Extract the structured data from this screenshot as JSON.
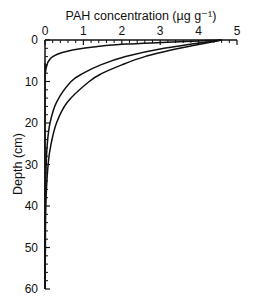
{
  "chart_data": {
    "type": "line",
    "title": "",
    "xlabel": "PAH concentration (µg g⁻¹)",
    "ylabel": "Depth (cm)",
    "xlim": [
      0,
      5
    ],
    "ylim": [
      60,
      0
    ],
    "x_axis_position": "top",
    "y_inverted": true,
    "grid": false,
    "xticks": [
      0,
      1,
      2,
      3,
      4,
      5
    ],
    "yticks": [
      0,
      10,
      20,
      30,
      40,
      50,
      60
    ],
    "series": [
      {
        "name": "profile-1",
        "depth": [
          0,
          1,
          2,
          3,
          4,
          5,
          6,
          8,
          10,
          60
        ],
        "concentration": [
          4.6,
          2.1,
          1.0,
          0.45,
          0.2,
          0.1,
          0.05,
          0.01,
          0.0,
          0.0
        ]
      },
      {
        "name": "profile-2",
        "depth": [
          0,
          2,
          4,
          6,
          8,
          10,
          15,
          20,
          25,
          30,
          40,
          60
        ],
        "concentration": [
          4.6,
          3.1,
          2.1,
          1.45,
          1.0,
          0.68,
          0.3,
          0.13,
          0.06,
          0.03,
          0.01,
          0.0
        ]
      },
      {
        "name": "profile-3",
        "depth": [
          0,
          2,
          4,
          6,
          8,
          10,
          15,
          20,
          25,
          30,
          40,
          50,
          60
        ],
        "concentration": [
          4.6,
          3.5,
          2.6,
          2.0,
          1.5,
          1.15,
          0.58,
          0.3,
          0.16,
          0.08,
          0.02,
          0.01,
          0.0
        ]
      }
    ]
  },
  "axes": {
    "x_title": "PAH concentration (µg g⁻¹)",
    "y_title": "Depth (cm)",
    "x_tick_labels": [
      "0",
      "1",
      "2",
      "3",
      "4",
      "5"
    ],
    "y_tick_labels": [
      "0",
      "10",
      "20",
      "30",
      "40",
      "50",
      "60"
    ]
  }
}
